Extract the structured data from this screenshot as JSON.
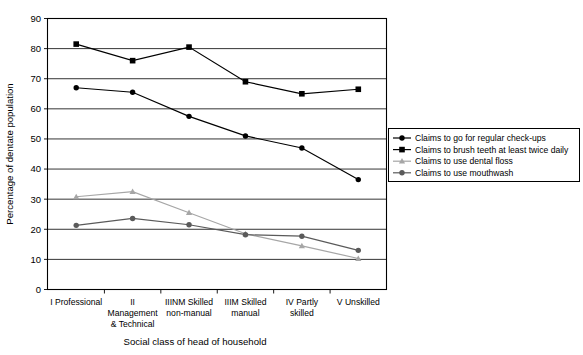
{
  "chart_data": {
    "type": "line",
    "title": "",
    "xlabel": "Social class of head of household",
    "ylabel": "Percentage of dentate population",
    "ylim": [
      0,
      90
    ],
    "yticks": [
      0,
      10,
      20,
      30,
      40,
      50,
      60,
      70,
      80,
      90
    ],
    "grid": true,
    "legend_position": "right",
    "categories": [
      "I Professional",
      "II Management & Technical",
      "IIINM Skilled non-manual",
      "IIIM Skilled manual",
      "IV Partly skilled",
      "V Unskilled"
    ],
    "category_lines": [
      [
        "I Professional"
      ],
      [
        "II",
        "Management",
        "& Technical"
      ],
      [
        "IIINM Skilled",
        "non-manual"
      ],
      [
        "IIIM Skilled",
        "manual"
      ],
      [
        "IV Partly",
        "skilled"
      ],
      [
        "V Unskilled"
      ]
    ],
    "series": [
      {
        "name": "Claims to go for regular check-ups",
        "marker": "diamond",
        "color": "#000000",
        "values": [
          67,
          65.5,
          57.5,
          51,
          47,
          36.5
        ]
      },
      {
        "name": "Claims to brush teeth at least twice daily",
        "marker": "square",
        "color": "#000000",
        "values": [
          81.5,
          76,
          80.5,
          69,
          65,
          66.5
        ]
      },
      {
        "name": "Claims to use dental floss",
        "marker": "triangle",
        "color": "#a6a6a6",
        "values": [
          30.8,
          32.5,
          25.5,
          18.5,
          14.5,
          10.3
        ]
      },
      {
        "name": "Claims to use mouthwash",
        "marker": "circle",
        "color": "#5a5a5a",
        "values": [
          21.3,
          23.6,
          21.5,
          18.2,
          17.7,
          13
        ]
      }
    ]
  },
  "axis": {
    "y_title": "Percentage of dentate population",
    "x_title": "Social class of head of household"
  },
  "legend": {
    "items": [
      {
        "label": "Claims to go for regular check-ups"
      },
      {
        "label": "Claims to brush teeth at least twice daily"
      },
      {
        "label": "Claims to use dental floss"
      },
      {
        "label": "Claims to use mouthwash"
      }
    ]
  },
  "colors": {
    "axis": "#000000",
    "grid": "#000000",
    "series_dark": "#000000",
    "series_gray": "#a6a6a6",
    "series_midgray": "#5a5a5a",
    "background": "#ffffff"
  }
}
